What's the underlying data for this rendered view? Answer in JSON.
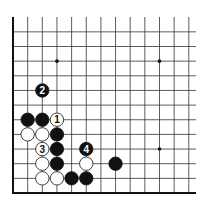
{
  "board": {
    "grid": {
      "left_edge_x": 13,
      "bottom_edge_y": 193,
      "spacing": 14.65,
      "cols": 13,
      "rows": 13,
      "top_open": true,
      "right_open": true
    },
    "colors": {
      "black": "#111111",
      "white": "#ffffff",
      "line": "#333333"
    },
    "star_points": [
      {
        "col": 3,
        "row": 9
      },
      {
        "col": 10,
        "row": 9
      },
      {
        "col": 10,
        "row": 3
      }
    ],
    "stones": [
      {
        "color": "black",
        "col": 1,
        "row": 5,
        "label": ""
      },
      {
        "color": "black",
        "col": 2,
        "row": 5,
        "label": ""
      },
      {
        "color": "white",
        "col": 3,
        "row": 5,
        "label": "1"
      },
      {
        "color": "white",
        "col": 1,
        "row": 4,
        "label": ""
      },
      {
        "color": "white",
        "col": 2,
        "row": 4,
        "label": ""
      },
      {
        "color": "black",
        "col": 3,
        "row": 4,
        "label": ""
      },
      {
        "color": "white",
        "col": 2,
        "row": 3,
        "label": "3"
      },
      {
        "color": "black",
        "col": 3,
        "row": 3,
        "label": ""
      },
      {
        "color": "black",
        "col": 5,
        "row": 3,
        "label": "4"
      },
      {
        "color": "white",
        "col": 2,
        "row": 2,
        "label": ""
      },
      {
        "color": "black",
        "col": 3,
        "row": 2,
        "label": ""
      },
      {
        "color": "white",
        "col": 5,
        "row": 2,
        "label": ""
      },
      {
        "color": "black",
        "col": 7,
        "row": 2,
        "label": ""
      },
      {
        "color": "white",
        "col": 2,
        "row": 1,
        "label": ""
      },
      {
        "color": "white",
        "col": 3,
        "row": 1,
        "label": ""
      },
      {
        "color": "black",
        "col": 4,
        "row": 1,
        "label": ""
      },
      {
        "color": "black",
        "col": 5,
        "row": 1,
        "label": ""
      },
      {
        "color": "black",
        "col": 2,
        "row": 7,
        "label": "2"
      }
    ]
  }
}
